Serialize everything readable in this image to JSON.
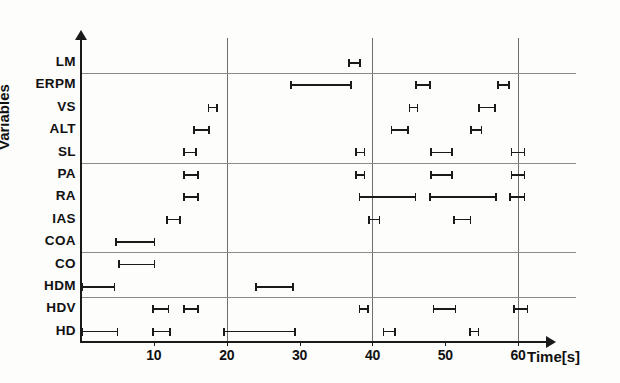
{
  "chart_data": {
    "type": "bar",
    "title": "",
    "xlabel": "Time[s]",
    "ylabel": "Variables",
    "xlim": [
      0,
      62
    ],
    "ylim": [
      0,
      13
    ],
    "grid": true,
    "legend": null,
    "xticks": [
      {
        "value": 10,
        "label": "10"
      },
      {
        "value": 20,
        "label": "20"
      },
      {
        "value": 30,
        "label": "30"
      },
      {
        "value": 40,
        "label": "40"
      },
      {
        "value": 50,
        "label": "50"
      },
      {
        "value": 60,
        "label": "60"
      }
    ],
    "vertical_gridlines": [
      20,
      40,
      60
    ],
    "horizontal_gridlines_after": [
      "LM",
      "SL",
      "COA",
      "HDM"
    ],
    "categories": [
      "LM",
      "ERPM",
      "VS",
      "ALT",
      "SL",
      "PA",
      "RA",
      "IAS",
      "COA",
      "CO",
      "HDM",
      "HDV",
      "HD"
    ],
    "series": [
      {
        "name": "LM",
        "intervals": [
          [
            36.7,
            38.4
          ]
        ]
      },
      {
        "name": "ERPM",
        "intervals": [
          [
            28.7,
            37.2
          ],
          [
            45.9,
            48.0
          ],
          [
            57.1,
            58.9
          ]
        ]
      },
      {
        "name": "VS",
        "intervals": [
          [
            17.4,
            18.8
          ],
          [
            45.0,
            46.3
          ],
          [
            54.5,
            56.9
          ]
        ]
      },
      {
        "name": "ALT",
        "intervals": [
          [
            15.4,
            17.7
          ],
          [
            42.5,
            45.0
          ],
          [
            53.4,
            55.1
          ]
        ]
      },
      {
        "name": "SL",
        "intervals": [
          [
            14.0,
            15.9
          ],
          [
            37.6,
            39.0
          ],
          [
            47.9,
            51.0
          ],
          [
            59.0,
            61.0
          ]
        ]
      },
      {
        "name": "PA",
        "intervals": [
          [
            14.0,
            16.2
          ],
          [
            37.6,
            39.0
          ],
          [
            47.9,
            51.0
          ],
          [
            59.0,
            61.0
          ]
        ]
      },
      {
        "name": "RA",
        "intervals": [
          [
            14.0,
            16.2
          ],
          [
            38.1,
            46.0
          ],
          [
            47.8,
            57.1
          ],
          [
            58.8,
            61.0
          ]
        ]
      },
      {
        "name": "IAS",
        "intervals": [
          [
            11.7,
            13.7
          ],
          [
            39.4,
            41.1
          ],
          [
            51.1,
            53.6
          ]
        ]
      },
      {
        "name": "COA",
        "intervals": [
          [
            4.7,
            10.2
          ]
        ]
      },
      {
        "name": "CO",
        "intervals": [
          [
            5.1,
            10.2
          ]
        ]
      },
      {
        "name": "HDM",
        "intervals": [
          [
            0.0,
            4.7
          ],
          [
            23.9,
            29.2
          ]
        ]
      },
      {
        "name": "HDV",
        "intervals": [
          [
            9.8,
            12.1
          ],
          [
            14.0,
            16.2
          ],
          [
            38.1,
            39.5
          ],
          [
            48.3,
            51.5
          ],
          [
            59.3,
            61.4
          ]
        ]
      },
      {
        "name": "HD",
        "intervals": [
          [
            0.0,
            5.1
          ],
          [
            9.8,
            12.3
          ],
          [
            19.5,
            29.5
          ],
          [
            41.4,
            43.2
          ],
          [
            53.3,
            54.7
          ]
        ]
      }
    ]
  }
}
